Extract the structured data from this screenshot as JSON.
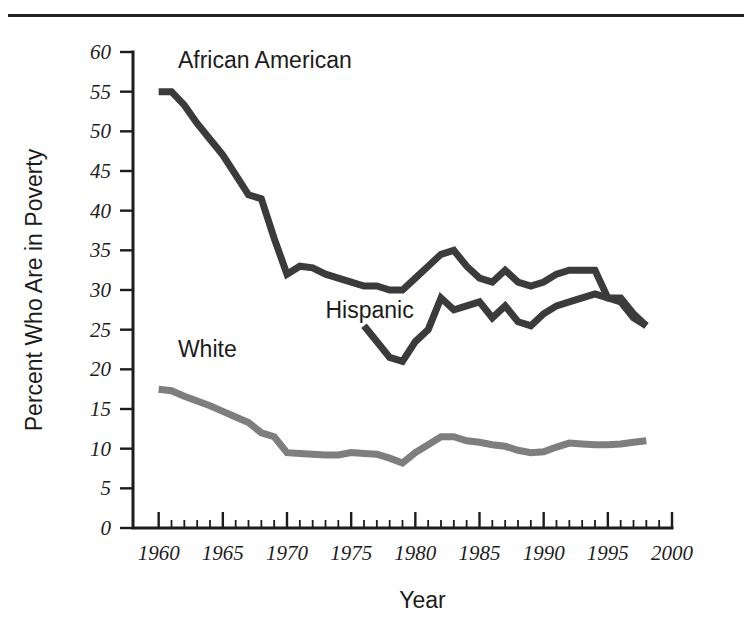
{
  "figure": {
    "top_rule": true,
    "background_color": "#ffffff"
  },
  "chart_data": {
    "type": "line",
    "title": "",
    "subtitle": "",
    "xlabel": "Year",
    "ylabel": "Percent Who Are in Poverty",
    "xlim": [
      1958,
      2000
    ],
    "ylim": [
      0,
      60
    ],
    "x_major_ticks": [
      1960,
      1965,
      1970,
      1975,
      1980,
      1985,
      1990,
      1995,
      2000
    ],
    "x_tick_labels": [
      "1960",
      "1965",
      "1970",
      "1975",
      "1980",
      "1985",
      "1990",
      "1995",
      "2000"
    ],
    "x_minor_tick_step": 1,
    "y_major_ticks": [
      0,
      5,
      10,
      15,
      20,
      25,
      30,
      35,
      40,
      45,
      50,
      55,
      60
    ],
    "y_tick_labels": [
      "0",
      "5",
      "10",
      "15",
      "20",
      "25",
      "30",
      "35",
      "40",
      "45",
      "50",
      "55",
      "60"
    ],
    "grid": false,
    "legend_position": "inline-labels",
    "series": [
      {
        "name": "African American",
        "color": "#3b3b3b",
        "label_x": 1961.5,
        "label_y": 58.0,
        "x": [
          1960,
          1961,
          1962,
          1963,
          1964,
          1965,
          1966,
          1967,
          1968,
          1969,
          1970,
          1971,
          1972,
          1973,
          1974,
          1975,
          1976,
          1977,
          1978,
          1979,
          1980,
          1981,
          1982,
          1983,
          1984,
          1985,
          1986,
          1987,
          1988,
          1989,
          1990,
          1991,
          1992,
          1993,
          1994,
          1995,
          1996,
          1997,
          1998
        ],
        "y": [
          55.0,
          55.0,
          53.3,
          51.0,
          49.0,
          47.0,
          44.5,
          42.0,
          41.5,
          36.5,
          32.0,
          33.0,
          32.8,
          32.0,
          31.5,
          31.0,
          30.5,
          30.5,
          30.0,
          30.0,
          31.5,
          33.0,
          34.5,
          35.0,
          33.0,
          31.5,
          31.0,
          32.5,
          31.0,
          30.5,
          31.0,
          32.0,
          32.5,
          32.5,
          32.5,
          29.0,
          28.5,
          26.5,
          25.5
        ]
      },
      {
        "name": "Hispanic",
        "color": "#3b3b3b",
        "label_x": 1973.0,
        "label_y": 26.5,
        "x": [
          1976,
          1977,
          1978,
          1979,
          1980,
          1981,
          1982,
          1983,
          1984,
          1985,
          1986,
          1987,
          1988,
          1989,
          1990,
          1991,
          1992,
          1993,
          1994,
          1995,
          1996,
          1997,
          1998
        ],
        "y": [
          25.5,
          23.5,
          21.5,
          21.0,
          23.5,
          25.0,
          29.0,
          27.5,
          28.0,
          28.5,
          26.5,
          28.0,
          26.0,
          25.5,
          27.0,
          28.0,
          28.5,
          29.0,
          29.5,
          29.0,
          29.0,
          27.0,
          25.5
        ]
      },
      {
        "name": "White",
        "color": "#7e7e7e",
        "label_x": 1961.5,
        "label_y": 21.5,
        "x": [
          1960,
          1961,
          1962,
          1963,
          1964,
          1965,
          1966,
          1967,
          1968,
          1969,
          1970,
          1971,
          1972,
          1973,
          1974,
          1975,
          1976,
          1977,
          1978,
          1979,
          1980,
          1981,
          1982,
          1983,
          1984,
          1985,
          1986,
          1987,
          1988,
          1989,
          1990,
          1991,
          1992,
          1993,
          1994,
          1995,
          1996,
          1997,
          1998
        ],
        "y": [
          17.5,
          17.3,
          16.6,
          16.0,
          15.4,
          14.7,
          14.0,
          13.3,
          12.0,
          11.5,
          9.5,
          9.4,
          9.3,
          9.2,
          9.2,
          9.5,
          9.4,
          9.3,
          8.8,
          8.2,
          9.5,
          10.5,
          11.5,
          11.5,
          11.0,
          10.8,
          10.5,
          10.3,
          9.8,
          9.5,
          9.6,
          10.2,
          10.7,
          10.6,
          10.5,
          10.5,
          10.6,
          10.8,
          11.0
        ]
      }
    ]
  }
}
